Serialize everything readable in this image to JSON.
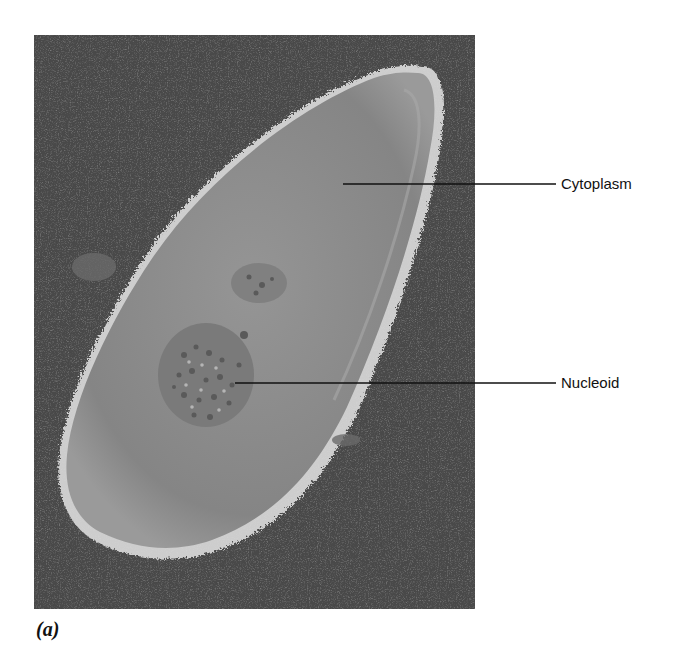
{
  "figure": {
    "panel_label": "(a)",
    "image_description": "Micrograph of a rod-shaped bacterial cell",
    "colors": {
      "background": "#4a4a4a",
      "cell_body": "#8a8a8a",
      "cell_edge": "#d8d8d8",
      "nucleoid": "#6e6e6e",
      "text": "#111111"
    },
    "labels": [
      {
        "id": "cytoplasm",
        "text": "Cytoplasm"
      },
      {
        "id": "nucleoid",
        "text": "Nucleoid"
      }
    ]
  }
}
